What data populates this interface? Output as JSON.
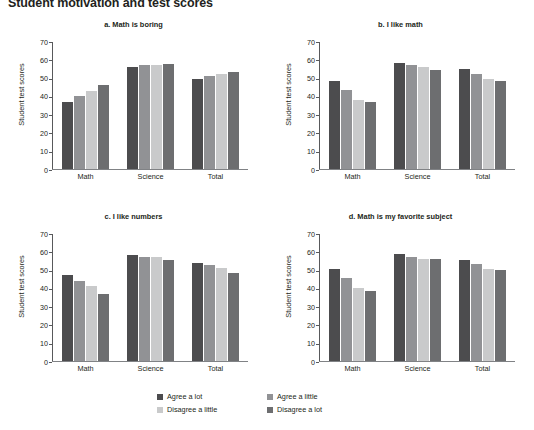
{
  "title": "Student motivation and test scores",
  "axis": {
    "ylabel": "Student test scores",
    "yticks": [
      "70",
      "60",
      "50",
      "40",
      "30",
      "20",
      "10",
      "0"
    ],
    "categories": [
      "Math",
      "Science",
      "Total"
    ]
  },
  "legend": {
    "items": [
      {
        "label": "Agree a lot",
        "color": "#4c4c4e"
      },
      {
        "label": "Agree a little",
        "color": "#919295"
      },
      {
        "label": "Disagree a little",
        "color": "#c9cacb"
      },
      {
        "label": "Disagree a lot",
        "color": "#6d6e70"
      }
    ]
  },
  "chart_data": [
    {
      "type": "bar",
      "title": "a. Math is boring",
      "xlabel": "",
      "ylabel": "Student test scores",
      "ylim": [
        0,
        70
      ],
      "grid": false,
      "legend_position": "bottom",
      "categories": [
        "Math",
        "Science",
        "Total"
      ],
      "series": [
        {
          "name": "Agree a lot",
          "values": [
            36.5,
            56.0,
            49.0
          ]
        },
        {
          "name": "Agree a little",
          "values": [
            40.0,
            57.0,
            51.0
          ]
        },
        {
          "name": "Disagree a little",
          "values": [
            42.5,
            57.0,
            52.0
          ]
        },
        {
          "name": "Disagree a lot",
          "values": [
            46.0,
            57.5,
            53.0
          ]
        }
      ]
    },
    {
      "type": "bar",
      "title": "b. I like math",
      "xlabel": "",
      "ylabel": "Student test scores",
      "ylim": [
        0,
        70
      ],
      "grid": false,
      "legend_position": "bottom",
      "categories": [
        "Math",
        "Science",
        "Total"
      ],
      "series": [
        {
          "name": "Agree a lot",
          "values": [
            48.0,
            58.0,
            54.5
          ]
        },
        {
          "name": "Agree a little",
          "values": [
            43.0,
            57.0,
            52.0
          ]
        },
        {
          "name": "Disagree a little",
          "values": [
            37.5,
            56.0,
            49.5
          ]
        },
        {
          "name": "Disagree a lot",
          "values": [
            36.5,
            54.0,
            48.0
          ]
        }
      ]
    },
    {
      "type": "bar",
      "title": "c. I like numbers",
      "xlabel": "",
      "ylabel": "Student test scores",
      "ylim": [
        0,
        70
      ],
      "grid": false,
      "legend_position": "bottom",
      "categories": [
        "Math",
        "Science",
        "Total"
      ],
      "series": [
        {
          "name": "Agree a lot",
          "values": [
            47.0,
            58.0,
            53.5
          ]
        },
        {
          "name": "Agree a little",
          "values": [
            44.0,
            57.0,
            52.5
          ]
        },
        {
          "name": "Disagree a little",
          "values": [
            41.0,
            57.0,
            51.0
          ]
        },
        {
          "name": "Disagree a lot",
          "values": [
            36.5,
            55.0,
            48.0
          ]
        }
      ]
    },
    {
      "type": "bar",
      "title": "d. Math is my favorite subject",
      "xlabel": "",
      "ylabel": "Student test scores",
      "ylim": [
        0,
        70
      ],
      "grid": false,
      "legend_position": "bottom",
      "categories": [
        "Math",
        "Science",
        "Total"
      ],
      "series": [
        {
          "name": "Agree a lot",
          "values": [
            50.5,
            58.5,
            55.5
          ]
        },
        {
          "name": "Agree a little",
          "values": [
            45.5,
            57.0,
            53.0
          ]
        },
        {
          "name": "Disagree a little",
          "values": [
            40.0,
            56.0,
            50.5
          ]
        },
        {
          "name": "Disagree a lot",
          "values": [
            38.5,
            56.0,
            50.0
          ]
        }
      ]
    }
  ]
}
